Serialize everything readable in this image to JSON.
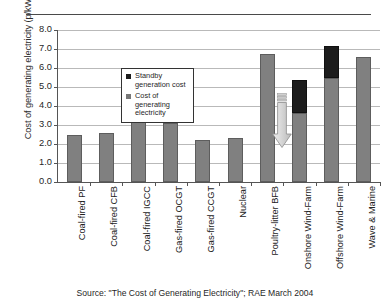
{
  "figure": {
    "source_note": "Source: \"The Cost of Generating Electricity\"; RAE March 2004"
  },
  "legend": {
    "position": "inside-top-left",
    "items": [
      {
        "key": "standby",
        "label": "Standby generation cost",
        "color": "#1c1c1c"
      },
      {
        "key": "cost",
        "label": "Cost of generating electricity",
        "color": "#808080"
      }
    ]
  },
  "annotation": {
    "type": "down-arrow",
    "color": "#d4d4d4",
    "from_value": 5.8,
    "to_value": 3.3,
    "over_category": "Nuclear"
  },
  "chart_data": {
    "type": "bar",
    "title": "",
    "xlabel": "",
    "ylabel": "Cost of generating electricity (p/kWh)",
    "ylim": [
      0.0,
      8.0
    ],
    "ytick_step": 1.0,
    "ytick_labels": [
      "8.0",
      "7.0",
      "6.0",
      "5.0",
      "4.0",
      "3.0",
      "2.0",
      "1.0",
      "0.0"
    ],
    "grid": "horizontal",
    "stacked": true,
    "legend_position": "inside-top-left",
    "categories": [
      "Coal-fired PF",
      "Coal-fired CFB",
      "Coal-fired IGCC",
      "Gas-fired OCGT",
      "Gas-fired CCGT",
      "Nuclear",
      "Poultry-litter BFB",
      "Onshore Wind-Farm",
      "Offshore Wind-Farm",
      "Wave & Marine"
    ],
    "series": [
      {
        "name": "Cost of generating electricity",
        "color": "#808080",
        "values": [
          2.5,
          2.6,
          3.2,
          3.1,
          2.2,
          2.3,
          6.75,
          3.65,
          5.5,
          6.6
        ]
      },
      {
        "name": "Standby generation cost",
        "color": "#1c1c1c",
        "values": [
          0,
          0,
          0,
          0,
          0,
          0,
          0,
          1.7,
          1.65,
          0
        ]
      }
    ],
    "totals": [
      2.5,
      2.6,
      3.2,
      3.1,
      2.2,
      2.3,
      6.75,
      5.35,
      7.15,
      6.6
    ]
  }
}
